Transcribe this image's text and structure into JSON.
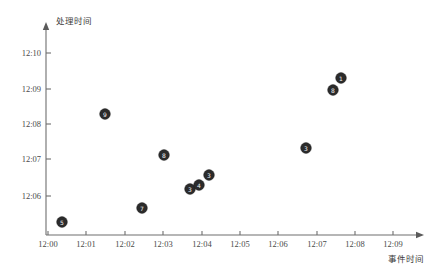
{
  "chart_data": {
    "type": "scatter",
    "title": "",
    "xlabel": "事件时间",
    "ylabel": "处理时间",
    "grid": false,
    "legend": "none",
    "xtick_labels": [
      "12:00",
      "12:01",
      "12:02",
      "12:03",
      "12:04",
      "12:05",
      "12:06",
      "12:07",
      "12:08",
      "12:09"
    ],
    "ytick_labels": [
      "12:06",
      "12:07",
      "12:08",
      "12:09",
      "12:10"
    ],
    "xlim": [
      "12:00",
      "12:09"
    ],
    "ylim": [
      "12:05.3",
      "12:10.4"
    ],
    "points": [
      {
        "label": "5",
        "x": "12:00.4",
        "y": "12:05.4",
        "px": 62,
        "py": 222
      },
      {
        "label": "9",
        "x": "12:01.5",
        "y": "12:08.2",
        "px": 105,
        "py": 114
      },
      {
        "label": "7",
        "x": "12:02.5",
        "y": "12:05.7",
        "px": 142,
        "py": 208
      },
      {
        "label": "8",
        "x": "12:03.1",
        "y": "12:07.1",
        "px": 164,
        "py": 155
      },
      {
        "label": "3",
        "x": "12:03.8",
        "y": "12:06.2",
        "px": 190,
        "py": 189
      },
      {
        "label": "4",
        "x": "12:04.0",
        "y": "12:06.3",
        "px": 199,
        "py": 185
      },
      {
        "label": "3",
        "x": "12:04.3",
        "y": "12:06.6",
        "px": 209,
        "py": 175
      },
      {
        "label": "3",
        "x": "12:06.8",
        "y": "12:07.3",
        "px": 306,
        "py": 148
      },
      {
        "label": "8",
        "x": "12:07.5",
        "y": "12:08.8",
        "px": 333,
        "py": 90
      },
      {
        "label": "1",
        "x": "12:07.7",
        "y": "12:09.1",
        "px": 341,
        "py": 78
      }
    ],
    "axis_geometry": {
      "x_axis_y": 235,
      "y_axis_x": 46,
      "x_ticks_px": [
        48,
        86,
        125,
        163,
        202,
        240,
        278,
        317,
        355,
        393
      ],
      "y_ticks_px": [
        196,
        159,
        124,
        89,
        53
      ],
      "x_axis_start": 46,
      "x_axis_end": 424,
      "y_axis_top": 22,
      "y_axis_bottom": 235
    },
    "colors": {
      "point_fill": "#2b2b2b",
      "axis": "#6e6e6e",
      "text": "#4a4a4a",
      "background": "#ffffff"
    }
  }
}
